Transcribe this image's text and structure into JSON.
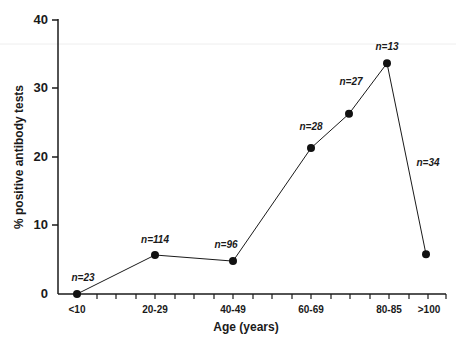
{
  "chart_data": {
    "type": "line",
    "title": "",
    "xlabel": "Age (years)",
    "ylabel": "% positive antibody tests",
    "ylim": [
      0,
      40
    ],
    "yticks": [
      0,
      10,
      20,
      30,
      40
    ],
    "grid": false,
    "legend": null,
    "x_tick_labels": [
      "<10",
      "20-29",
      "40-49",
      "60-69",
      "80-85",
      ">100"
    ],
    "categories": [
      "<10",
      "20-29",
      "40-49",
      "60-69",
      "70-79",
      "80-85",
      ">100"
    ],
    "values": [
      0,
      5.7,
      4.8,
      21.3,
      26.3,
      33.7,
      5.8
    ],
    "annotations": [
      "n=23",
      "n=114",
      "n=96",
      "n=28",
      "n=27",
      "n=13",
      "n=34"
    ],
    "points": [
      {
        "category": "<10",
        "value": 0,
        "n": "n=23"
      },
      {
        "category": "20-29",
        "value": 5.7,
        "n": "n=114"
      },
      {
        "category": "40-49",
        "value": 4.8,
        "n": "n=96"
      },
      {
        "category": "60-69",
        "value": 21.3,
        "n": "n=28"
      },
      {
        "category": "70-79",
        "value": 26.3,
        "n": "n=27"
      },
      {
        "category": "80-85",
        "value": 33.7,
        "n": "n=13"
      },
      {
        "category": ">100",
        "value": 5.8,
        "n": "n=34"
      }
    ]
  },
  "axes": {
    "x_title": "Age (years)",
    "y_title": "% positive antibody tests",
    "y_tick_labels": [
      "0",
      "10",
      "20",
      "30",
      "40"
    ]
  },
  "colors": {
    "line": "#1a1a1a",
    "marker": "#111111",
    "background": "#ffffff"
  }
}
